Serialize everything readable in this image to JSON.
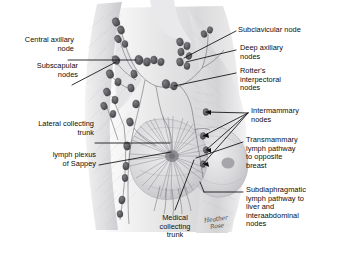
{
  "figure": {
    "kind": "medical-illustration",
    "background_color": "#ffffff",
    "ink_color": "#0d0d0d",
    "node_color": "#5f5f63",
    "vessel_color": "#6d6d70",
    "skin_shading_color": "#c9c9cc"
  },
  "labels": {
    "central_axillary_node": "Central axillary\nnode",
    "subscapular_nodes": "Subscapular\nnodes",
    "lateral_collecting_trunk": "Lateral collecting\ntrunk",
    "lymph_plexus_of_sappey": "lymph plexus\nof Sappey",
    "medical_collecting_trunk": "Medical\ncollecting\ntrunk",
    "subclavicular_node": "Subclavicular node",
    "deep_axillary_nodes": "Deep axillary\nnodes",
    "rotters_interpectoral_nodes": "Rotter's\ninterpectoral\nnodes",
    "intermammary_nodes": "Intermammary\nnodes",
    "transmammary_pathway": "Transmammary\nlymph pathway\nto opposite\nbreast",
    "subdiaphragmatic_pathway": "Subdiaphragmatic\nlymph pathway to\nliver and\ninteraabdominal\nnodes"
  },
  "signature": {
    "line1": "Heather",
    "line2": "Rose"
  }
}
